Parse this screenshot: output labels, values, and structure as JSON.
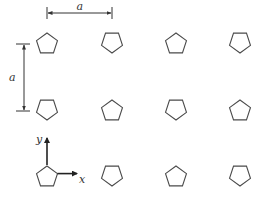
{
  "diagram": {
    "colors": {
      "stroke": "#4a4a4a",
      "background": "#ffffff"
    },
    "lattice": {
      "columns_x": [
        47,
        112,
        176,
        240
      ],
      "rows_y": [
        43,
        110,
        176
      ],
      "pentagon_radius": 11,
      "orientations": [
        [
          "up",
          "down",
          "up",
          "down"
        ],
        [
          "down",
          "up",
          "down",
          "up"
        ],
        [
          "up",
          "down",
          "up",
          "down"
        ]
      ]
    },
    "dimensions": {
      "horizontal": {
        "label": "a",
        "x1": 47,
        "x2": 112,
        "y": 13
      },
      "vertical": {
        "label": "a",
        "x": 24,
        "y1": 44,
        "y2": 111
      }
    },
    "axes": {
      "origin": [
        47,
        176
      ],
      "x_label": "x",
      "y_label": "y"
    }
  }
}
